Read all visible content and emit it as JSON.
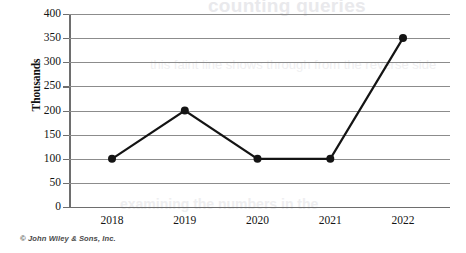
{
  "chart_data": {
    "type": "line",
    "title": "",
    "xlabel": "",
    "ylabel": "Thousands",
    "categories": [
      "2018",
      "2019",
      "2020",
      "2021",
      "2022"
    ],
    "values": [
      100,
      200,
      100,
      100,
      350
    ],
    "series": [
      {
        "name": "",
        "values": [
          100,
          200,
          100,
          100,
          350
        ]
      }
    ],
    "ylim": [
      0,
      400
    ],
    "ytick_labels": [
      "400",
      "350",
      "300",
      "250",
      "200",
      "150",
      "100",
      "50",
      "0"
    ],
    "ytick_values": [
      400,
      350,
      300,
      250,
      200,
      150,
      100,
      50,
      0
    ],
    "ytick_interval": 50,
    "grid": true,
    "grid_axis": "y",
    "legend": false,
    "legend_position": "none",
    "markers": "filled-circle",
    "line_color": "#141414",
    "marker_color": "#141414",
    "grid_color": "#8c8c8c",
    "axis_color": "#6e6e6e",
    "background_color": "#ffffff"
  },
  "credit": {
    "text": "© John Wiley & Sons, Inc."
  },
  "page_bleed": {
    "title": "counting queries",
    "line_a": "this faint line shows through from the reverse side",
    "line_b": "examining the numbers in the"
  }
}
